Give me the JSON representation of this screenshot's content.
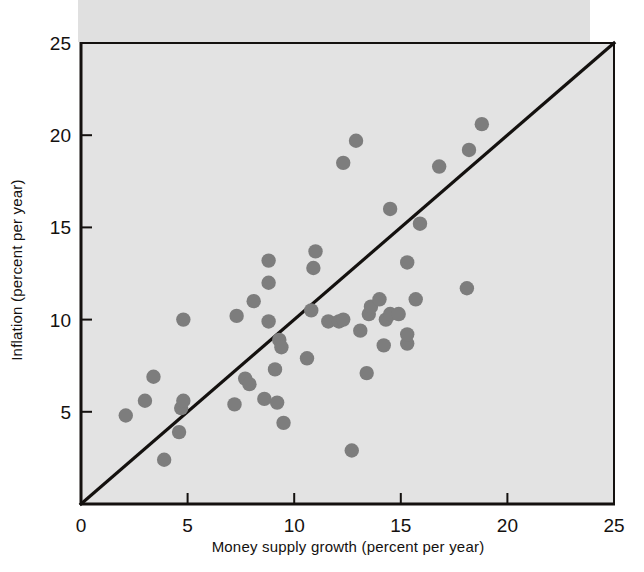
{
  "figure": {
    "name": "inflation-vs-money-supply-growth-scatter",
    "background_color": "#ffffff",
    "plot_background_color": "#e3e3e3",
    "ink_color": "#14110f",
    "dot_color": "#7d7d7d"
  },
  "axes": {
    "x": {
      "label": "Money supply growth (percent per year)",
      "ticks": [
        0,
        5,
        10,
        15,
        20,
        25
      ],
      "tick_labels": [
        "0",
        "5",
        "10",
        "15",
        "20",
        "25"
      ],
      "min": 0,
      "max": 25
    },
    "y": {
      "label": "Inflation (percent per year)",
      "ticks": [
        5,
        10,
        15,
        20,
        25
      ],
      "tick_labels": [
        "5",
        "10",
        "15",
        "20",
        "25"
      ],
      "min": 0,
      "max": 25
    }
  },
  "reference_line": {
    "name": "forty-five-degree-line",
    "from": [
      0,
      0
    ],
    "to": [
      25,
      25
    ],
    "description": "45-degree line"
  },
  "chart_data": {
    "type": "scatter",
    "title": "",
    "xlabel": "Money supply growth (percent per year)",
    "ylabel": "Inflation (percent per year)",
    "xlim": [
      0,
      25
    ],
    "ylim": [
      0,
      25
    ],
    "xticks": [
      0,
      5,
      10,
      15,
      20,
      25
    ],
    "yticks": [
      5,
      10,
      15,
      20,
      25
    ],
    "grid": false,
    "legend": "none",
    "annotations": [
      "45-degree line from (0,0) to (25,25)"
    ],
    "series": [
      {
        "name": "countries",
        "marker": "filled-circle",
        "color": "#7d7d7d",
        "points": [
          [
            2.1,
            4.8
          ],
          [
            3.0,
            5.6
          ],
          [
            3.4,
            6.9
          ],
          [
            3.9,
            2.4
          ],
          [
            4.6,
            3.9
          ],
          [
            4.7,
            5.2
          ],
          [
            4.8,
            5.6
          ],
          [
            4.8,
            10.0
          ],
          [
            7.2,
            5.4
          ],
          [
            7.3,
            10.2
          ],
          [
            7.7,
            6.8
          ],
          [
            7.9,
            6.5
          ],
          [
            8.1,
            11.0
          ],
          [
            8.6,
            5.7
          ],
          [
            8.8,
            9.9
          ],
          [
            8.8,
            13.2
          ],
          [
            8.8,
            12.0
          ],
          [
            9.1,
            7.3
          ],
          [
            9.2,
            5.5
          ],
          [
            9.3,
            8.9
          ],
          [
            9.4,
            8.5
          ],
          [
            9.5,
            4.4
          ],
          [
            10.6,
            7.9
          ],
          [
            10.8,
            10.5
          ],
          [
            10.9,
            12.8
          ],
          [
            11.0,
            13.7
          ],
          [
            11.6,
            9.9
          ],
          [
            12.1,
            9.9
          ],
          [
            12.3,
            10.0
          ],
          [
            12.3,
            18.5
          ],
          [
            12.7,
            2.9
          ],
          [
            12.9,
            19.7
          ],
          [
            13.1,
            9.4
          ],
          [
            13.4,
            7.1
          ],
          [
            13.5,
            10.3
          ],
          [
            13.6,
            10.7
          ],
          [
            14.0,
            11.1
          ],
          [
            14.2,
            8.6
          ],
          [
            14.3,
            10.0
          ],
          [
            14.5,
            10.3
          ],
          [
            14.5,
            16.0
          ],
          [
            14.9,
            10.3
          ],
          [
            15.3,
            8.7
          ],
          [
            15.3,
            9.2
          ],
          [
            15.3,
            13.1
          ],
          [
            15.7,
            11.1
          ],
          [
            15.9,
            15.2
          ],
          [
            16.8,
            18.3
          ],
          [
            18.1,
            11.7
          ],
          [
            18.2,
            19.2
          ],
          [
            18.8,
            20.6
          ]
        ]
      }
    ]
  }
}
